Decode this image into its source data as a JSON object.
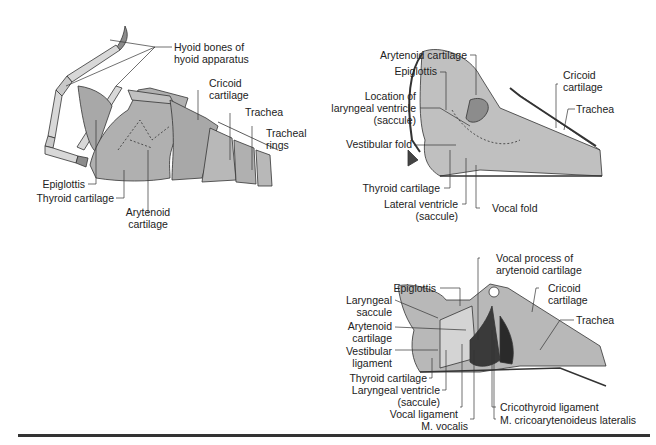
{
  "figure": {
    "panels": [
      {
        "id": "external-lateral",
        "labels": {
          "hyoid": "Hyoid bones of",
          "hyoid2": "hyoid apparatus",
          "cricoid": "Cricoid",
          "cricoid2": "cartilage",
          "trachea": "Trachea",
          "rings": "Tracheal",
          "rings2": "rings",
          "epiglottis": "Epiglottis",
          "thyroid": "Thyroid cartilage",
          "arytenoid": "Arytenoid",
          "arytenoid2": "cartilage"
        }
      },
      {
        "id": "sagittal-section",
        "labels": {
          "arytenoid": "Arytenoid cartilage",
          "epiglottis": "Epiglottis",
          "location": "Location of",
          "location2": "laryngeal ventricle",
          "location3": "(saccule)",
          "vestibular": "Vestibular fold",
          "thyroid": "Thyroid cartilage",
          "lateral": "Lateral ventricle",
          "lateral2": "(saccule)",
          "vocal_fold": "Vocal fold",
          "cricoid": "Cricoid",
          "cricoid2": "cartilage",
          "trachea": "Trachea"
        }
      },
      {
        "id": "deep-dissection",
        "labels": {
          "vocal_process": "Vocal process of",
          "vocal_process2": "arytenoid cartilage",
          "epiglottis": "Epiglottis",
          "saccule": "Laryngeal",
          "saccule2": "saccule",
          "arytenoid": "Arytenoid",
          "arytenoid2": "cartilage",
          "vestibular": "Vestibular",
          "vestibular2": "ligament",
          "thyroid": "Thyroid cartilage",
          "ventricle": "Laryngeal ventricle",
          "ventricle2": "(saccule)",
          "vocal_lig": "Vocal ligament",
          "vocalis": "M. vocalis",
          "cricoid": "Cricoid",
          "cricoid2": "cartilage",
          "trachea": "Trachea",
          "cricothyroid": "Cricothyroid ligament",
          "crico_lat": "M. cricoarytenoideus lateralis"
        }
      }
    ],
    "colors": {
      "tissue": "#b4b4b4",
      "tissue_light": "#d2d2d2",
      "tissue_dark": "#8c8c8c",
      "muscle": "#3a3a3a",
      "line": "#333333"
    }
  }
}
